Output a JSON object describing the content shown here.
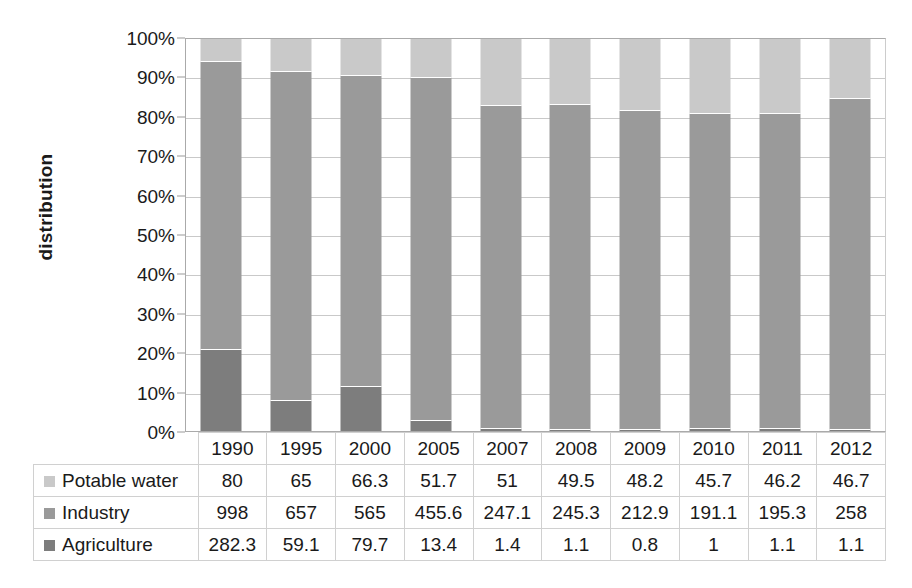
{
  "chart_data": {
    "type": "bar",
    "stacked": true,
    "normalized": true,
    "title": "",
    "xlabel": "",
    "ylabel": "distribution",
    "ylim": [
      0,
      100
    ],
    "ytick_labels": [
      "100%",
      "90%",
      "80%",
      "70%",
      "60%",
      "50%",
      "40%",
      "30%",
      "20%",
      "10%",
      "0%"
    ],
    "ytick_values": [
      100,
      90,
      80,
      70,
      60,
      50,
      40,
      30,
      20,
      10,
      0
    ],
    "grid": true,
    "legend_position": "table-left",
    "categories": [
      "1990",
      "1995",
      "2000",
      "2005",
      "2007",
      "2008",
      "2009",
      "2010",
      "2011",
      "2012"
    ],
    "series": [
      {
        "name": "Potable water",
        "color": "#c9c9c9",
        "values": [
          80,
          65,
          66.3,
          51.7,
          51,
          49.5,
          48.2,
          45.7,
          46.2,
          46.7
        ],
        "display": [
          "80",
          "65",
          "66.3",
          "51.7",
          "51",
          "49.5",
          "48.2",
          "45.7",
          "46.2",
          "46.7"
        ],
        "percent": [
          5.6,
          8.3,
          9.3,
          9.9,
          17.0,
          16.7,
          18.4,
          19.2,
          19.0,
          15.3
        ]
      },
      {
        "name": "Industry",
        "color": "#9a9a9a",
        "values": [
          998,
          657,
          565,
          455.6,
          247.1,
          245.3,
          212.9,
          191.1,
          195.3,
          258
        ],
        "display": [
          "998",
          "657",
          "565",
          "455.6",
          "247.1",
          "245.3",
          "212.9",
          "191.1",
          "195.3",
          "258"
        ],
        "percent": [
          73.4,
          84.3,
          79.5,
          87.5,
          82.5,
          82.9,
          81.3,
          80.4,
          80.5,
          84.3
        ]
      },
      {
        "name": "Agriculture",
        "color": "#7d7d7d",
        "values": [
          282.3,
          59.1,
          79.7,
          13.4,
          1.4,
          1.1,
          0.8,
          1,
          1.1,
          1.1
        ],
        "display": [
          "282.3",
          "59.1",
          "79.7",
          "13.4",
          "1.4",
          "1.1",
          "0.8",
          "1",
          "1.1",
          "1.1"
        ],
        "percent": [
          20.8,
          7.6,
          11.2,
          2.6,
          0.5,
          0.4,
          0.3,
          0.4,
          0.5,
          0.4
        ]
      }
    ]
  },
  "colors": {
    "potable_water": "#c9c9c9",
    "industry": "#9a9a9a",
    "agriculture": "#7d7d7d",
    "gridline": "#c9c9c9",
    "axis": "#aaaaaa",
    "table_border": "#d0d0d0",
    "background": "#ffffff"
  }
}
